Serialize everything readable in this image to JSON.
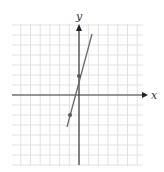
{
  "figure": {
    "x_axis_label": "x",
    "y_axis_label": "y"
  },
  "colors": {
    "grid": "#e2e2e2",
    "axis": "#3a3a3a",
    "line": "#6a6a6a",
    "point": "#5a5a5a"
  },
  "chart_data": {
    "type": "line",
    "title": "",
    "xlabel": "x",
    "ylabel": "y",
    "grid": true,
    "xlim": [
      -7,
      7
    ],
    "ylim": [
      -7,
      7
    ],
    "tick_labels": "none",
    "series": [
      {
        "name": "line",
        "x": [
          -1.3,
          1.4
        ],
        "y": [
          -3.2,
          6.1
        ]
      }
    ],
    "points": [
      {
        "x": 0,
        "y": 2
      },
      {
        "x": -1,
        "y": -2
      }
    ]
  }
}
